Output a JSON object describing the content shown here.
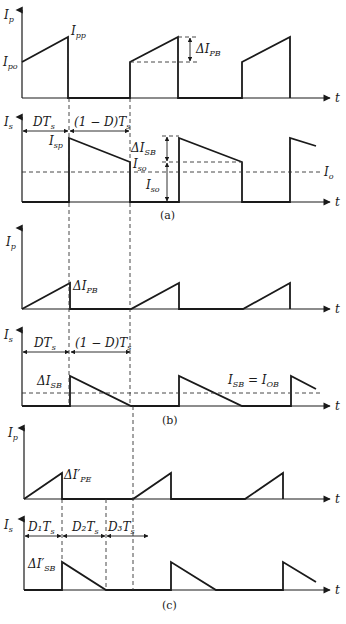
{
  "figure": {
    "panels": [
      {
        "caption": "(a)",
        "primary": {
          "y_label": "I",
          "y_label_sub": "p",
          "x_label": "t",
          "labels": {
            "peak": {
              "main": "I",
              "sub": "pp"
            },
            "start": {
              "main": "I",
              "sub": "po"
            },
            "ripple": {
              "main": "ΔI",
              "sub": "PB"
            }
          }
        },
        "secondary": {
          "y_label": "I",
          "y_label_sub": "s",
          "x_label": "t",
          "intervals": [
            "DT",
            "(1 − D)T"
          ],
          "interval_sub": "s",
          "labels": {
            "peak": {
              "main": "I",
              "sub": "sp"
            },
            "valley": {
              "main": "I",
              "sub": "so"
            },
            "ripple": {
              "main": "ΔI",
              "sub": "SB"
            },
            "dc": {
              "main": "I",
              "sub": "so"
            },
            "output": {
              "main": "I",
              "sub": "o"
            }
          }
        }
      },
      {
        "caption": "(b)",
        "primary": {
          "y_label": "I",
          "y_label_sub": "p",
          "x_label": "t",
          "labels": {
            "ripple": {
              "main": "ΔI",
              "sub": "PB"
            }
          }
        },
        "secondary": {
          "y_label": "I",
          "y_label_sub": "s",
          "x_label": "t",
          "intervals": [
            "DT",
            "(1 − D)T"
          ],
          "interval_sub": "s",
          "labels": {
            "ripple": {
              "main": "ΔI",
              "sub": "SB"
            },
            "boundary": {
              "left": "I",
              "left_sub": "SB",
              "eq": " = ",
              "right": "I",
              "right_sub": "OB"
            }
          }
        }
      },
      {
        "caption": "(c)",
        "primary": {
          "y_label": "I",
          "y_label_sub": "p",
          "x_label": "t",
          "labels": {
            "ripple": {
              "main": "ΔI′",
              "sub": "PE"
            }
          }
        },
        "secondary": {
          "y_label": "I",
          "y_label_sub": "s",
          "x_label": "t",
          "intervals": [
            "D₁T",
            "D₂T",
            "D₃T"
          ],
          "interval_sub": "s",
          "labels": {
            "ripple": {
              "main": "ΔI′",
              "sub": "SB"
            }
          }
        }
      }
    ]
  }
}
